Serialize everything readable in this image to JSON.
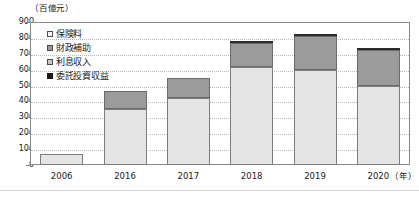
{
  "chart_data": {
    "type": "bar",
    "stacked": true,
    "title": "",
    "subtitle": "",
    "unit_caption": "（百億元）",
    "xlabel": "（年）",
    "ylabel": "",
    "ylim": [
      0,
      900
    ],
    "ytick_step": 100,
    "grid": true,
    "legend_position": "top-left",
    "categories": [
      "2006",
      "2016",
      "2017",
      "2018",
      "2019",
      "2020"
    ],
    "ytick_labels": [
      "900",
      "800",
      "700",
      "600",
      "500",
      "400",
      "300",
      "200",
      "100",
      "0"
    ],
    "series": [
      {
        "name": "保険料",
        "key": "hoken",
        "color": "#e4e4e4",
        "values": [
          70,
          355,
          420,
          620,
          600,
          500
        ]
      },
      {
        "name": "財政補助",
        "key": "zaisei",
        "color": "#9b9b9b",
        "values": [
          0,
          110,
          125,
          150,
          210,
          225
        ]
      },
      {
        "name": "利息収入",
        "key": "risoku",
        "color": "#c9c9c9",
        "values": [
          0,
          0,
          0,
          0,
          0,
          0
        ]
      },
      {
        "name": "委託投資収益",
        "key": "itaku",
        "color": "#2b2b2b",
        "values": [
          0,
          0,
          0,
          5,
          5,
          5
        ]
      }
    ],
    "totals": [
      70,
      465,
      545,
      775,
      815,
      730
    ]
  },
  "legend": {
    "items": [
      {
        "label": "保険料",
        "swatch": "legend-swatch-white"
      },
      {
        "label": "財政補助",
        "swatch": "legend-swatch-gray"
      },
      {
        "label": "利息収入",
        "swatch": "legend-swatch-lightgray"
      },
      {
        "label": "委託投資収益",
        "swatch": "legend-swatch-black"
      }
    ]
  }
}
